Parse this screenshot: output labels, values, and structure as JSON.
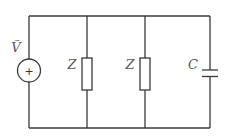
{
  "diagram": {
    "type": "circuit",
    "source": {
      "label": "Ṽ",
      "symbol": "+",
      "kind": "ac-voltage-source"
    },
    "branches": [
      {
        "label": "Z",
        "kind": "impedance"
      },
      {
        "label": "Z",
        "kind": "impedance"
      },
      {
        "label": "C",
        "kind": "capacitor"
      }
    ],
    "colors": {
      "wire": "#3a3a3a",
      "label": "#555555",
      "background": "#ffffff"
    }
  }
}
